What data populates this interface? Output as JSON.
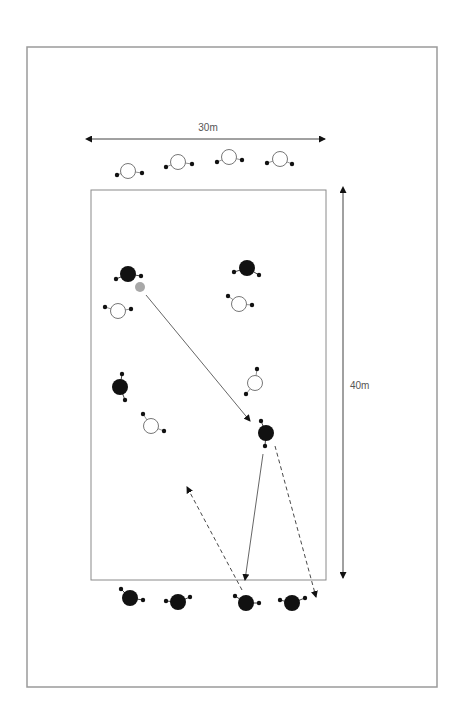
{
  "diagram": {
    "colors": {
      "frame": "#9a9a9a",
      "field": "#8a8a8a",
      "ink": "#111111",
      "ball": "#a8a8a8",
      "open_player_stroke": "#777777"
    },
    "frame": {
      "x": 27,
      "y": 47,
      "w": 410,
      "h": 640
    },
    "field": {
      "x": 91,
      "y": 190,
      "w": 235,
      "h": 390
    },
    "dimensions": {
      "width_label": "30m",
      "length_label": "40m",
      "width_arrow": {
        "x1": 91,
        "y1": 139,
        "x2": 325,
        "y2": 139
      },
      "length_arrow": {
        "x1": 343,
        "y1": 192,
        "x2": 343,
        "y2": 578
      }
    },
    "players_open": [
      {
        "x": 128,
        "y": 171,
        "hands": [
          [
            117,
            175
          ],
          [
            142,
            173
          ]
        ]
      },
      {
        "x": 178,
        "y": 162,
        "hands": [
          [
            166,
            167
          ],
          [
            192,
            164
          ]
        ]
      },
      {
        "x": 229,
        "y": 157,
        "hands": [
          [
            217,
            162
          ],
          [
            242,
            160
          ]
        ]
      },
      {
        "x": 280,
        "y": 159,
        "hands": [
          [
            267,
            163
          ],
          [
            292,
            164
          ]
        ]
      },
      {
        "x": 118,
        "y": 311,
        "hands": [
          [
            105,
            307
          ],
          [
            131,
            309
          ]
        ]
      },
      {
        "x": 239,
        "y": 304,
        "hands": [
          [
            228,
            296
          ],
          [
            252,
            305
          ]
        ]
      },
      {
        "x": 255,
        "y": 383,
        "hands": [
          [
            257,
            369
          ],
          [
            246,
            394
          ]
        ]
      },
      {
        "x": 151,
        "y": 426,
        "hands": [
          [
            143,
            414
          ],
          [
            164,
            431
          ]
        ]
      }
    ],
    "players_solid": [
      {
        "x": 128,
        "y": 274,
        "hands": [
          [
            116,
            279
          ],
          [
            141,
            276
          ]
        ]
      },
      {
        "x": 247,
        "y": 268,
        "hands": [
          [
            234,
            272
          ],
          [
            259,
            275
          ]
        ]
      },
      {
        "x": 120,
        "y": 387,
        "hands": [
          [
            122,
            374
          ],
          [
            125,
            400
          ]
        ]
      },
      {
        "x": 266,
        "y": 433,
        "hands": [
          [
            261,
            421
          ],
          [
            265,
            446
          ]
        ]
      },
      {
        "x": 130,
        "y": 598,
        "hands": [
          [
            121,
            589
          ],
          [
            143,
            600
          ]
        ]
      },
      {
        "x": 178,
        "y": 602,
        "hands": [
          [
            166,
            601
          ],
          [
            190,
            597
          ]
        ]
      },
      {
        "x": 246,
        "y": 603,
        "hands": [
          [
            235,
            596
          ],
          [
            259,
            603
          ]
        ]
      },
      {
        "x": 292,
        "y": 603,
        "hands": [
          [
            280,
            600
          ],
          [
            305,
            598
          ]
        ]
      }
    ],
    "ball": {
      "x": 140,
      "y": 287,
      "r": 5
    },
    "movements": [
      {
        "type": "pass",
        "style": "solid",
        "x1": 146,
        "y1": 295,
        "x2": 250,
        "y2": 421
      },
      {
        "type": "pass",
        "style": "solid",
        "x1": 263,
        "y1": 454,
        "x2": 245,
        "y2": 580
      },
      {
        "type": "run",
        "style": "dashed",
        "x1": 242,
        "y1": 590,
        "x2": 187,
        "y2": 487
      },
      {
        "type": "run",
        "style": "dashed",
        "x1": 275,
        "y1": 446,
        "x2": 316,
        "y2": 597
      }
    ]
  }
}
